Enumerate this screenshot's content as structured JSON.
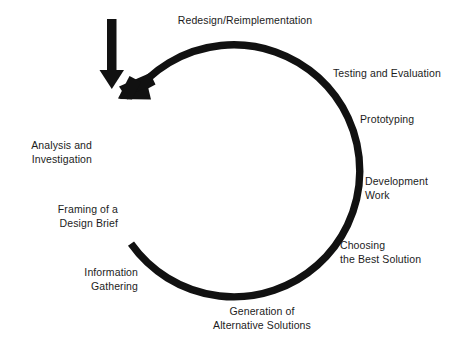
{
  "diagram": {
    "colors": {
      "stroke": "#111111",
      "text": "#1c1c1c",
      "background": "#ffffff"
    },
    "circle": {
      "center_x": 222,
      "center_y": 170,
      "radius": 126,
      "stroke_width": 7
    },
    "entry_arrow": {
      "name": "downward-entry-arrow",
      "direction": "down",
      "shaft_top_y": 19,
      "tip_y": 89,
      "x": 111
    },
    "cycle_arrowhead": {
      "name": "cycle-arrowhead",
      "direction": "down-left",
      "angle_deg": 228
    },
    "break_marks": {
      "name": "cycle-break-hatching",
      "count": 4
    },
    "stages": [
      {
        "id": "redesign",
        "label": "Redesign/Reimplementation",
        "align": "center",
        "position": "top"
      },
      {
        "id": "testing",
        "label": "Testing and Evaluation",
        "align": "left",
        "position": "upper-right"
      },
      {
        "id": "prototyping",
        "label": "Prototyping",
        "align": "left",
        "position": "right-upper"
      },
      {
        "id": "development",
        "label": "Development\nWork",
        "align": "left",
        "position": "right"
      },
      {
        "id": "choosing",
        "label": "Choosing\nthe Best Solution",
        "align": "left",
        "position": "lower-right"
      },
      {
        "id": "generation",
        "label": "Generation of\nAlternative Solutions",
        "align": "center",
        "position": "bottom"
      },
      {
        "id": "information",
        "label": "Information\nGathering",
        "align": "right",
        "position": "lower-left"
      },
      {
        "id": "framing",
        "label": "Framing of a\nDesign Brief",
        "align": "right",
        "position": "left-lower"
      },
      {
        "id": "analysis",
        "label": "Analysis and\nInvestigation",
        "align": "right",
        "position": "left-upper"
      }
    ]
  }
}
